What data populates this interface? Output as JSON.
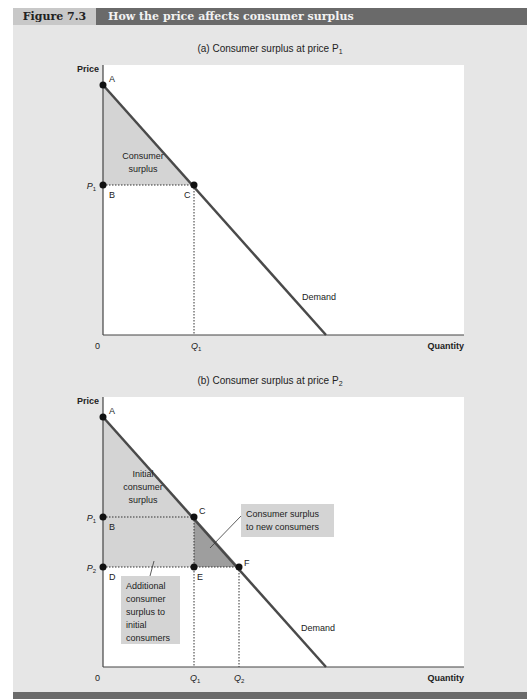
{
  "figure": {
    "number": "Figure 7.3",
    "title": "How the price affects consumer surplus"
  },
  "panel_a": {
    "title": "(a) Consumer surplus at price P",
    "title_sub": "1",
    "y_axis_label": "Price",
    "x_axis_label": "Quantity",
    "origin": "0",
    "points": {
      "A": "A",
      "B": "B",
      "C": "C"
    },
    "price_label": "P",
    "price_sub": "1",
    "qty_label": "Q",
    "qty_sub": "1",
    "area_label_line1": "Consumer",
    "area_label_line2": "surplus",
    "curve_label": "Demand"
  },
  "panel_b": {
    "title": "(b) Consumer surplus at price P",
    "title_sub": "2",
    "y_axis_label": "Price",
    "x_axis_label": "Quantity",
    "origin": "0",
    "points": {
      "A": "A",
      "B": "B",
      "C": "C",
      "D": "D",
      "E": "E",
      "F": "F"
    },
    "price1_label": "P",
    "price1_sub": "1",
    "price2_label": "P",
    "price2_sub": "2",
    "qty1_label": "Q",
    "qty1_sub": "1",
    "qty2_label": "Q",
    "qty2_sub": "2",
    "initial_line1": "Initial",
    "initial_line2": "consumer",
    "initial_line3": "surplus",
    "new_line1": "Consumer surplus",
    "new_line2": "to new consumers",
    "additional_line1": "Additional",
    "additional_line2": "consumer",
    "additional_line3": "surplus to",
    "additional_line4": "initial",
    "additional_line5": "consumers",
    "curve_label": "Demand"
  },
  "colors": {
    "panel_bg": "#e6e6e6",
    "plot_bg": "#ffffff",
    "header_dark": "#6a6a6a",
    "header_light": "#c8c8c8",
    "shade_light": "#d4d4d4",
    "shade_dark": "#9e9e9e",
    "curve": "#4a4a4a"
  }
}
